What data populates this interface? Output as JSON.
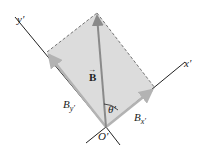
{
  "diagram": {
    "axes": {
      "y_axis": "y′",
      "x_axis": "x′",
      "origin": "O′"
    },
    "vector": {
      "name": "B",
      "arrow_symbol": "→"
    },
    "components": {
      "y_label": "B",
      "y_sub": "y′",
      "x_label": "B",
      "x_sub": "x′"
    },
    "angle": {
      "label": "θ′"
    },
    "colors": {
      "fill": "#dcdcdc",
      "component_arrow": "#b3b3b3",
      "vector": "#8a8a8a",
      "axis": "#222222",
      "dashed": "#555555"
    }
  }
}
